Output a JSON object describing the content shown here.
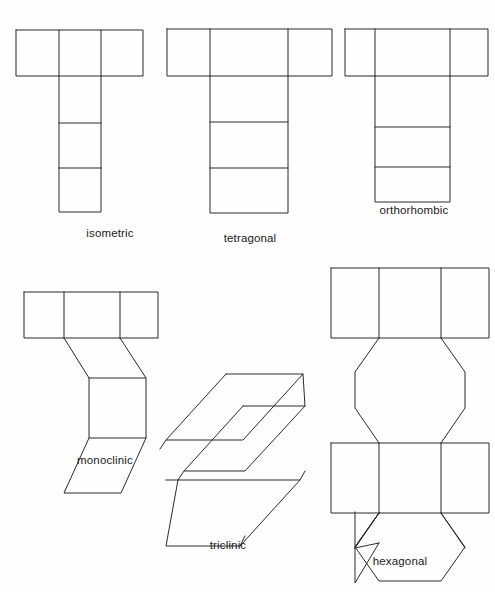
{
  "figure": {
    "background_color": "#fefefe",
    "stroke_color": "#2b2b2b",
    "stroke_width": 1,
    "label_color": "#1a1a1a",
    "label_font_size": 11.5
  },
  "nets": [
    {
      "id": "isometric",
      "label": "isometric",
      "label_x": 110,
      "label_y": 228,
      "description": "T-shaped net of six equal squares: three in a horizontal row with three descending from the middle column",
      "shape_type": "square-net",
      "polylines": [
        "16,30 143,30 143,76 16,76 16,30",
        "59,30 59,76",
        "101,30 101,76",
        "59,76 59,212 101,212 101,76",
        "59,123 101,123",
        "59,168 101,168"
      ]
    },
    {
      "id": "tetragonal",
      "label": "tetragonal",
      "label_x": 250,
      "label_y": 233,
      "description": "T-shaped net: three cells in a horizontal row, with three taller rectangles descending from the middle column",
      "shape_type": "rect-net",
      "polylines": [
        "167,29 332,29 332,76 167,76 167,29",
        "210,29 210,76",
        "288,29 288,76",
        "210,76 210,213 288,213 288,76",
        "210,122 288,122",
        "210,168 288,168"
      ]
    },
    {
      "id": "orthorhombic",
      "label": "orthorhombic",
      "label_x": 414,
      "label_y": 205,
      "description": "T-shaped net: three cells in a horizontal row, with three rectangles of differing heights descending from the middle column",
      "shape_type": "rect-net",
      "polylines": [
        "345,29 488,29 488,76 345,76 345,29",
        "375,29 375,76",
        "450,29 450,76",
        "375,76 375,202 450,202 450,76",
        "375,127 450,127",
        "375,167 450,167"
      ]
    },
    {
      "id": "monoclinic",
      "label": "monoclinic",
      "label_x": 105,
      "label_y": 455,
      "description": "Net with three squares in a top row, then a slanted parallelogram, a square face, and a lower slanted parallelogram",
      "shape_type": "oblique-net",
      "polylines": [
        "24,292 158,292 158,338 24,338 24,292",
        "64,292 64,338",
        "120,292 120,338",
        "64,338 89,378 146,378 120,338",
        "89,378 89,438 146,438 146,378",
        "89,438 64,493 121,493 146,438"
      ]
    },
    {
      "id": "triclinic",
      "label": "triclinic",
      "label_x": 228,
      "label_y": 540,
      "description": "Zigzag arrangement of four oblique parallelograms forming a triclinic cell net",
      "shape_type": "oblique-net",
      "polylines": [
        "226,374 303,374 243,440 166,440 226,374",
        "243,406 305,406 243,470 183,470 243,406",
        "178,480 300,480 240,546 166,546 178,480",
        "178,480 231,480 295,412 243,412",
        "240,546 300,546 305,470 243,470",
        "166,440 166,440",
        "226,374 226,374"
      ]
    },
    {
      "id": "hexagonal",
      "label": "hexagonal",
      "label_x": 400,
      "label_y": 556,
      "description": "Net of two rows of three squares alternating with two hexagonal faces",
      "shape_type": "hex-net",
      "polylines": [
        "331,268 489,268 489,338 331,338 331,268",
        "379,268 379,338",
        "441,268 441,338",
        "379,338 355,372 355,408 379,443 441,443 465,408 465,372 441,338",
        "331,443 489,443 489,513 331,513 331,443",
        "379,443 379,513",
        "441,443 441,513",
        "379,513 355,548 355,500 355,548 379,543",
        "379,513 355,548 355,500",
        "379,513 355,548 355,548",
        "379,513 355,548 358,548"
      ]
    }
  ]
}
